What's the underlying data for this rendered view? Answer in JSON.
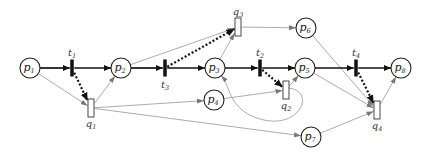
{
  "diagram": {
    "type": "petri-net",
    "places": [
      {
        "id": "p1",
        "base": "p",
        "sub": "1",
        "x": 30,
        "y": 68
      },
      {
        "id": "p2",
        "base": "p",
        "sub": "2",
        "x": 121,
        "y": 68
      },
      {
        "id": "p3",
        "base": "p",
        "sub": "3",
        "x": 215,
        "y": 68
      },
      {
        "id": "p4",
        "base": "p",
        "sub": "4",
        "x": 214,
        "y": 100
      },
      {
        "id": "p5",
        "base": "p",
        "sub": "5",
        "x": 305,
        "y": 68
      },
      {
        "id": "p6",
        "base": "p",
        "sub": "6",
        "x": 306,
        "y": 28
      },
      {
        "id": "p7",
        "base": "p",
        "sub": "7",
        "x": 311,
        "y": 137
      },
      {
        "id": "p8",
        "base": "p",
        "sub": "8",
        "x": 401,
        "y": 68
      }
    ],
    "transitions": [
      {
        "id": "t1",
        "base": "t",
        "sub": "1",
        "x": 72,
        "y": 68,
        "label_pos": "above"
      },
      {
        "id": "t3",
        "base": "t",
        "sub": "3",
        "x": 165,
        "y": 68,
        "label_pos": "below"
      },
      {
        "id": "t2",
        "base": "t",
        "sub": "2",
        "x": 260,
        "y": 68,
        "label_pos": "above"
      },
      {
        "id": "t4",
        "base": "t",
        "sub": "4",
        "x": 356,
        "y": 68,
        "label_pos": "above"
      }
    ],
    "q_transitions": [
      {
        "id": "q1",
        "base": "q",
        "sub": "1",
        "x": 91,
        "y": 108,
        "label_pos": "below"
      },
      {
        "id": "q3",
        "base": "q",
        "sub": "3",
        "x": 238,
        "y": 27,
        "label_pos": "above"
      },
      {
        "id": "q2",
        "base": "q",
        "sub": "2",
        "x": 286,
        "y": 90,
        "label_pos": "below"
      },
      {
        "id": "q4",
        "base": "q",
        "sub": "4",
        "x": 377,
        "y": 110,
        "label_pos": "below"
      }
    ],
    "arcs_main": [
      {
        "from": "p1",
        "to": "t1"
      },
      {
        "from": "t1",
        "to": "p2"
      },
      {
        "from": "p2",
        "to": "t3"
      },
      {
        "from": "t3",
        "to": "p3"
      },
      {
        "from": "p3",
        "to": "t2"
      },
      {
        "from": "t2",
        "to": "p5"
      },
      {
        "from": "p5",
        "to": "t4"
      },
      {
        "from": "t4",
        "to": "p8"
      }
    ],
    "arcs_dotted": [
      {
        "from": "t1",
        "to": "q1"
      },
      {
        "from": "t3",
        "to": "q3"
      },
      {
        "from": "t2",
        "to": "q2"
      },
      {
        "from": "t4",
        "to": "q4"
      }
    ],
    "arcs_thin": [
      {
        "from": "p1",
        "to": "q1"
      },
      {
        "from": "q1",
        "to": "p2"
      },
      {
        "from": "q1",
        "to": "p4"
      },
      {
        "from": "q1",
        "to": "p7"
      },
      {
        "from": "p2",
        "to": "q3"
      },
      {
        "from": "p3",
        "to": "q3"
      },
      {
        "from": "q3",
        "to": "p6"
      },
      {
        "from": "p4",
        "to": "q2"
      },
      {
        "from": "q2",
        "to": "p5"
      },
      {
        "from": "q2",
        "to": "p3",
        "curved": true
      },
      {
        "from": "p6",
        "to": "q4"
      },
      {
        "from": "p5",
        "to": "q4"
      },
      {
        "from": "p7",
        "to": "q4"
      },
      {
        "from": "q4",
        "to": "p8"
      }
    ],
    "colors": {
      "main_arc": "#111111",
      "thin_arc": "#888888",
      "node_stroke": "#222222",
      "background": "#ffffff"
    }
  }
}
